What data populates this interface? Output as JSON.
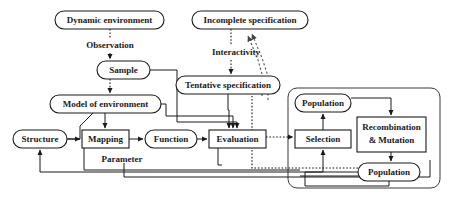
{
  "diagram": {
    "canvas": {
      "width": 450,
      "height": 204
    },
    "nodes": {
      "dynamic_environment": {
        "label": "Dynamic environment",
        "shape": "rounded",
        "x": 55,
        "y": 11,
        "w": 109,
        "h": 18
      },
      "incomplete_specification": {
        "label": "Incomplete specification",
        "shape": "rounded",
        "x": 192,
        "y": 11,
        "w": 116,
        "h": 18
      },
      "sample": {
        "label": "Sample",
        "shape": "rounded",
        "x": 97,
        "y": 61,
        "w": 53,
        "h": 18
      },
      "tentative_specification": {
        "label": "Tentative specification",
        "shape": "rounded",
        "x": 176,
        "y": 76,
        "w": 104,
        "h": 18
      },
      "model_of_environment": {
        "label": "Model of environment",
        "shape": "rounded",
        "x": 50,
        "y": 95,
        "w": 111,
        "h": 18
      },
      "structure": {
        "label": "Structure",
        "shape": "rounded",
        "x": 13,
        "y": 130,
        "w": 54,
        "h": 18
      },
      "mapping": {
        "label": "Mapping",
        "shape": "rect",
        "x": 82,
        "y": 130,
        "w": 47,
        "h": 18
      },
      "function": {
        "label": "Function",
        "shape": "rounded",
        "x": 145,
        "y": 130,
        "w": 52,
        "h": 18
      },
      "evaluation": {
        "label": "Evaluation",
        "shape": "rect",
        "x": 209,
        "y": 130,
        "w": 57,
        "h": 18
      },
      "population_top": {
        "label": "Population",
        "shape": "rounded",
        "x": 295,
        "y": 94,
        "w": 56,
        "h": 18
      },
      "selection": {
        "label": "Selection",
        "shape": "rect",
        "x": 295,
        "y": 130,
        "w": 56,
        "h": 18
      },
      "recombination_mutation": {
        "label": "Recombination\n& Mutation",
        "line1": "Recombination",
        "line2": "& Mutation",
        "shape": "rect",
        "x": 357,
        "y": 117,
        "w": 69,
        "h": 35
      },
      "population_bottom": {
        "label": "Population",
        "shape": "rounded",
        "x": 358,
        "y": 163,
        "w": 62,
        "h": 18
      }
    },
    "edge_labels": {
      "observation": {
        "label": "Observation",
        "x": 123,
        "y": 46
      },
      "interactivity": {
        "label": "Interactivity",
        "x": 250,
        "y": 53
      },
      "parameter": {
        "label": "Parameter",
        "x": 122,
        "y": 160
      }
    },
    "containers": {
      "evolution_group": {
        "name": "evolutionary-algorithm-group",
        "x": 288,
        "y": 88,
        "w": 152,
        "h": 100
      }
    },
    "colors": {
      "stroke": "#1a1a1a",
      "container_stroke": "#3a3a3a",
      "dashed_stroke": "#555555",
      "background": "#ffffff"
    },
    "edges": [
      {
        "from": "dynamic_environment",
        "to": "sample",
        "style": "dotted",
        "label": "Observation"
      },
      {
        "from": "sample",
        "to": "model_of_environment",
        "style": "dotted"
      },
      {
        "from": "incomplete_specification",
        "to": "tentative_specification",
        "style": "dotted",
        "label": "Interactivity"
      },
      {
        "from": "tentative_specification",
        "to": "incomplete_specification",
        "style": "dashed"
      },
      {
        "from": "evaluation",
        "to": "incomplete_specification",
        "style": "dashed"
      },
      {
        "from": "model_of_environment",
        "to": "mapping",
        "style": "solid"
      },
      {
        "from": "structure",
        "to": "mapping",
        "style": "solid"
      },
      {
        "from": "mapping",
        "to": "function",
        "style": "solid"
      },
      {
        "from": "function",
        "to": "evaluation",
        "style": "solid"
      },
      {
        "from": "evaluation",
        "to": "selection",
        "style": "dotted"
      },
      {
        "from": "selection",
        "to": "population_top",
        "style": "solid"
      },
      {
        "from": "population_top",
        "to": "recombination_mutation",
        "style": "solid"
      },
      {
        "from": "recombination_mutation",
        "to": "population_bottom",
        "style": "solid"
      },
      {
        "from": "population_bottom",
        "to": "selection",
        "style": "solid"
      },
      {
        "from": "population_bottom",
        "to": "structure",
        "style": "solid"
      },
      {
        "from": "sample",
        "to": "evaluation",
        "style": "solid"
      },
      {
        "from": "model_of_environment",
        "to": "evaluation",
        "style": "solid"
      },
      {
        "from": "tentative_specification",
        "to": "evaluation",
        "style": "solid"
      }
    ]
  }
}
